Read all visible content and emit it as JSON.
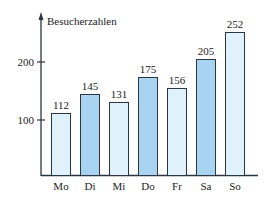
{
  "chart_data": {
    "type": "bar",
    "title": "",
    "xlabel": "",
    "ylabel": "Besucherzahlen",
    "categories": [
      "Mo",
      "Di",
      "Mi",
      "Do",
      "Fr",
      "Sa",
      "So"
    ],
    "values": [
      112,
      145,
      131,
      175,
      156,
      205,
      252
    ],
    "yticks": [
      100,
      200
    ],
    "ylim": [
      0,
      280
    ],
    "grid": false,
    "legend": null,
    "data_labels": true,
    "bar_colors": [
      "#dff1fb",
      "#a8d4f2",
      "#dff1fb",
      "#a8d4f2",
      "#dff1fb",
      "#a8d4f2",
      "#dff1fb"
    ]
  },
  "colors": {
    "light_bar": "#dff1fb",
    "dark_bar": "#a8d4f2",
    "outline": "#2a3540",
    "axis": "#2a3540"
  }
}
